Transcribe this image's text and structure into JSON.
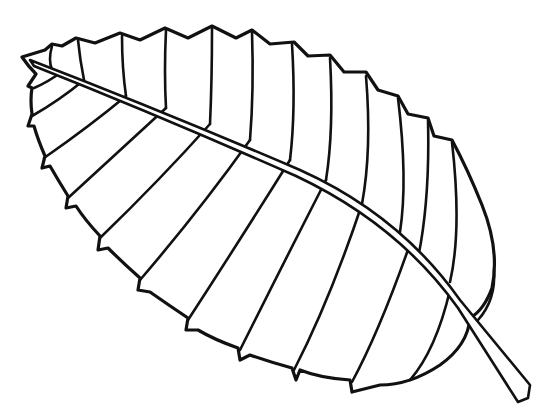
{
  "image": {
    "subject": "leaf line drawing",
    "alt": "Black and white outline drawing of a serrated leaf with midrib and lateral veins",
    "colors": {
      "background": "#ffffff",
      "line": "#111111"
    },
    "lateral_veins_upper": 13,
    "lateral_veins_lower": 12
  }
}
